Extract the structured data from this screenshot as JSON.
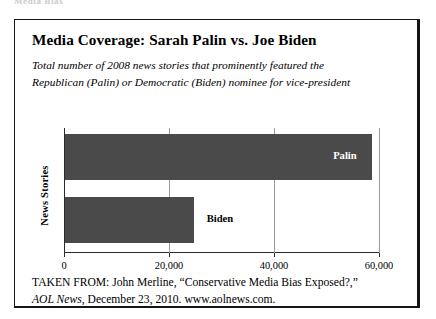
{
  "page": {
    "running_head": "Media Bias"
  },
  "figure": {
    "title": "Media Coverage: Sarah Palin vs. Joe Biden",
    "subtitle_line1": "Total number of 2008 news stories that prominently featured the",
    "subtitle_line2": "Republican (Palin) or Democratic (Biden) nominee for vice-president",
    "bar_color": "#4a4a4a",
    "border_color": "#151515",
    "gridline_color": "#9a9a9a"
  },
  "source": {
    "line1_prefix": "TAKEN FROM: John Merline, ",
    "line1_quote": "“Conservative Media Bias Exposed?,”",
    "line2_italic": "AOL News",
    "line2_rest": ", December 23, 2010. www.aolnews.com."
  },
  "chart_data": {
    "type": "bar",
    "orientation": "horizontal",
    "title": "Media Coverage: Sarah Palin vs. Joe Biden",
    "subtitle": "Total number of 2008 news stories that prominently featured the Republican (Palin) or Democratic (Biden) nominee for vice-president",
    "categories": [
      "Palin",
      "Biden"
    ],
    "values": [
      58500,
      24500
    ],
    "xlabel": "",
    "ylabel": "News Stories",
    "xlim": [
      0,
      60000
    ],
    "ylim": null,
    "xticks": [
      0,
      20000,
      40000,
      60000
    ],
    "xtick_labels": [
      "0",
      "20,000",
      "40,000",
      "60,000"
    ],
    "grid": "vertical",
    "legend": "none",
    "data_labels": [
      {
        "category": "Palin",
        "text": "Palin",
        "placement": "inside-end",
        "color": "#ffffff"
      },
      {
        "category": "Biden",
        "text": "Biden",
        "placement": "outside-end",
        "color": "#000000"
      }
    ]
  }
}
